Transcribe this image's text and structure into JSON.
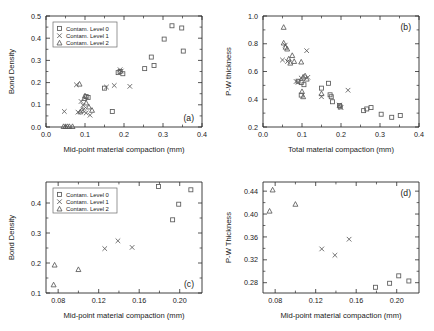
{
  "figure": {
    "panel_count": 4,
    "marker_color": "#5a5a5a",
    "axis_color": "#2b2b2b",
    "background": "#ffffff"
  },
  "legend": {
    "level0": "Contam. Level 0",
    "level1": "Contam. Level 1",
    "level2": "Contam. Level 2",
    "marker0": "open-square",
    "marker1": "cross-x",
    "marker2": "open-triangle"
  },
  "chart_data": [
    {
      "type": "scatter",
      "panel": "a",
      "tag": "(a)",
      "title": "",
      "xlabel": "Mid-point material compaction (mm)",
      "ylabel": "Bond Density",
      "xlim": [
        0.0,
        0.4
      ],
      "ylim": [
        0.0,
        0.5
      ],
      "xticks": [
        "0.0",
        "0.1",
        "0.2",
        "0.3",
        "0.4"
      ],
      "yticks": [
        "0.0",
        "0.1",
        "0.2",
        "0.3",
        "0.4",
        "0.5"
      ],
      "grid": false,
      "legend_position": "top-left",
      "series": [
        {
          "name": "Contam. Level 0",
          "marker": "open-square",
          "points": [
            [
              0.15,
              0.175
            ],
            [
              0.17,
              0.07
            ],
            [
              0.185,
              0.245
            ],
            [
              0.19,
              0.25
            ],
            [
              0.197,
              0.24
            ],
            [
              0.253,
              0.263
            ],
            [
              0.27,
              0.315
            ],
            [
              0.277,
              0.277
            ],
            [
              0.303,
              0.396
            ],
            [
              0.323,
              0.456
            ],
            [
              0.348,
              0.446
            ],
            [
              0.352,
              0.342
            ],
            [
              0.103,
              0.137
            ],
            [
              0.108,
              0.133
            ]
          ]
        },
        {
          "name": "Contam. Level 1",
          "marker": "cross-x",
          "points": [
            [
              0.047,
              0.07
            ],
            [
              0.078,
              0.19
            ],
            [
              0.082,
              0.067
            ],
            [
              0.09,
              0.115
            ],
            [
              0.095,
              0.098
            ],
            [
              0.098,
              0.082
            ],
            [
              0.103,
              0.063
            ],
            [
              0.113,
              0.053
            ],
            [
              0.155,
              0.18
            ],
            [
              0.175,
              0.187
            ],
            [
              0.19,
              0.258
            ],
            [
              0.193,
              0.252
            ],
            [
              0.215,
              0.183
            ]
          ]
        },
        {
          "name": "Contam. Level 2",
          "marker": "open-triangle",
          "points": [
            [
              0.045,
              0.002
            ],
            [
              0.05,
              0.002
            ],
            [
              0.055,
              0.002
            ],
            [
              0.06,
              0.002
            ],
            [
              0.068,
              0.002
            ],
            [
              0.086,
              0.193
            ],
            [
              0.088,
              0.068
            ],
            [
              0.092,
              0.075
            ],
            [
              0.098,
              0.128
            ],
            [
              0.103,
              0.108
            ],
            [
              0.11,
              0.09
            ],
            [
              0.118,
              0.075
            ],
            [
              0.1,
              0.14
            ]
          ]
        }
      ]
    },
    {
      "type": "scatter",
      "panel": "b",
      "tag": "(b)",
      "title": "",
      "xlabel": "Total material compaction (mm)",
      "ylabel": "P-W thickness",
      "xlim": [
        0.0,
        0.4
      ],
      "ylim": [
        0.2,
        1.0
      ],
      "xticks": [
        "0.0",
        "0.1",
        "0.2",
        "0.3",
        "0.4"
      ],
      "yticks": [
        "0.2",
        "0.4",
        "0.6",
        "0.8",
        "1.0"
      ],
      "grid": false,
      "legend_position": "none",
      "series": [
        {
          "name": "Contam. Level 0",
          "marker": "open-square",
          "points": [
            [
              0.09,
              0.53
            ],
            [
              0.098,
              0.52
            ],
            [
              0.105,
              0.505
            ],
            [
              0.098,
              0.43
            ],
            [
              0.15,
              0.48
            ],
            [
              0.168,
              0.515
            ],
            [
              0.172,
              0.432
            ],
            [
              0.175,
              0.418
            ],
            [
              0.178,
              0.382
            ],
            [
              0.196,
              0.355
            ],
            [
              0.198,
              0.345
            ],
            [
              0.258,
              0.318
            ],
            [
              0.266,
              0.33
            ],
            [
              0.277,
              0.34
            ],
            [
              0.303,
              0.292
            ],
            [
              0.33,
              0.27
            ],
            [
              0.352,
              0.283
            ]
          ]
        },
        {
          "name": "Contam. Level 1",
          "marker": "cross-x",
          "points": [
            [
              0.05,
              0.683
            ],
            [
              0.057,
              0.79
            ],
            [
              0.063,
              0.672
            ],
            [
              0.085,
              0.528
            ],
            [
              0.09,
              0.522
            ],
            [
              0.098,
              0.553
            ],
            [
              0.112,
              0.75
            ],
            [
              0.115,
              0.558
            ],
            [
              0.15,
              0.418
            ],
            [
              0.196,
              0.358
            ],
            [
              0.2,
              0.34
            ],
            [
              0.218,
              0.465
            ]
          ]
        },
        {
          "name": "Contam. Level 2",
          "marker": "open-triangle",
          "points": [
            [
              0.053,
              0.918
            ],
            [
              0.053,
              0.805
            ],
            [
              0.058,
              0.775
            ],
            [
              0.062,
              0.762
            ],
            [
              0.066,
              0.69
            ],
            [
              0.07,
              0.66
            ],
            [
              0.075,
              0.715
            ],
            [
              0.08,
              0.672
            ],
            [
              0.098,
              0.668
            ],
            [
              0.103,
              0.56
            ],
            [
              0.108,
              0.568
            ],
            [
              0.112,
              0.545
            ],
            [
              0.1,
              0.455
            ],
            [
              0.103,
              0.418
            ],
            [
              0.15,
              0.44
            ]
          ]
        }
      ]
    },
    {
      "type": "scatter",
      "panel": "c",
      "tag": "(c)",
      "title": "",
      "xlabel": "Mid-point material compaction (mm)",
      "ylabel": "Bond Density",
      "xlim": [
        0.068,
        0.222
      ],
      "ylim": [
        0.1,
        0.47
      ],
      "xticks": [
        "0.08",
        "0.12",
        "0.16",
        "0.20"
      ],
      "yticks": [
        "0.1",
        "0.2",
        "0.3",
        "0.4"
      ],
      "grid": false,
      "legend_position": "top-left",
      "series": [
        {
          "name": "Contam. Level 0",
          "marker": "open-square",
          "points": [
            [
              0.179,
              0.455
            ],
            [
              0.193,
              0.344
            ],
            [
              0.199,
              0.396
            ],
            [
              0.211,
              0.444
            ]
          ]
        },
        {
          "name": "Contam. Level 1",
          "marker": "cross-x",
          "points": [
            [
              0.126,
              0.248
            ],
            [
              0.139,
              0.274
            ],
            [
              0.153,
              0.252
            ]
          ]
        },
        {
          "name": "Contam. Level 2",
          "marker": "open-triangle",
          "points": [
            [
              0.0755,
              0.127
            ],
            [
              0.0765,
              0.193
            ],
            [
              0.1,
              0.178
            ]
          ]
        }
      ]
    },
    {
      "type": "scatter",
      "panel": "d",
      "tag": "(d)",
      "title": "",
      "xlabel": "Mid-point material compaction (mm)",
      "ylabel": "P-W Thickness",
      "xlim": [
        0.068,
        0.222
      ],
      "ylim": [
        0.262,
        0.456
      ],
      "xticks": [
        "0.08",
        "0.12",
        "0.16",
        "0.20"
      ],
      "yticks": [
        "0.28",
        "0.32",
        "0.36",
        "0.40",
        "0.44"
      ],
      "grid": false,
      "legend_position": "none",
      "series": [
        {
          "name": "Contam. Level 0",
          "marker": "open-square",
          "points": [
            [
              0.179,
              0.272
            ],
            [
              0.193,
              0.279
            ],
            [
              0.202,
              0.292
            ],
            [
              0.212,
              0.283
            ]
          ]
        },
        {
          "name": "Contam. Level 1",
          "marker": "cross-x",
          "points": [
            [
              0.126,
              0.339
            ],
            [
              0.139,
              0.328
            ],
            [
              0.153,
              0.356
            ]
          ]
        },
        {
          "name": "Contam. Level 2",
          "marker": "open-triangle",
          "points": [
            [
              0.0745,
              0.405
            ],
            [
              0.0775,
              0.442
            ],
            [
              0.1,
              0.417
            ]
          ]
        }
      ]
    }
  ]
}
